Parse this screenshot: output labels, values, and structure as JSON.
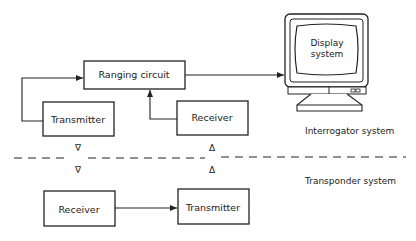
{
  "diagram": {
    "blocks": {
      "ranging_circuit": "Ranging circuit",
      "transmitter_top": "Transmitter",
      "receiver_top": "Receiver",
      "receiver_bottom": "Receiver",
      "transmitter_bottom": "Transmitter",
      "display_line1": "Display",
      "display_line2": "system"
    },
    "labels": {
      "interrogator": "Interrogator system",
      "transponder": "Transponder system"
    },
    "symbols": {
      "down": "∇",
      "up": "Δ"
    },
    "colors": {
      "line": "#222222",
      "background": "#ffffff"
    }
  }
}
